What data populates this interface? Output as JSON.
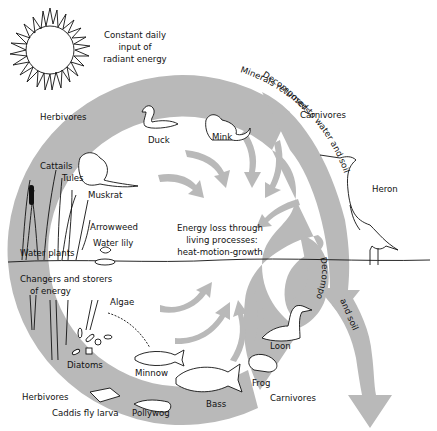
{
  "sun": {
    "icon": "sun-icon",
    "caption": [
      "Constant daily",
      "input of",
      "radiant energy"
    ]
  },
  "ring": {
    "fill_color": "#b9b9b9",
    "center_text": [
      "Energy loss through",
      "living processes:",
      "heat-motion-growth"
    ]
  },
  "sections": {
    "top_left_group": "Herbivores",
    "top_right_group": "Carnivores",
    "bottom_left_group": "Herbivores",
    "bottom_right_group": "Carnivores",
    "producers": [
      "Changers and storers",
      "of energy"
    ]
  },
  "organisms": {
    "duck": "Duck",
    "mink": "Mink",
    "muskrat": "Muskrat",
    "cattails": "Cattails",
    "tules": "Tules",
    "arrowweed": "Arrowweed",
    "water_lily": "Water lily",
    "water_plants": "Water plants",
    "algae": "Algae",
    "diatoms": "Diatoms",
    "minnow": "Minnow",
    "bass": "Bass",
    "frog": "Frog",
    "loon": "Loon",
    "heron": "Heron",
    "caddis_fly_larva": "Caddis fly larva",
    "pollywog": "Pollywog"
  },
  "flows": {
    "decomposers_outer": "Decomposers",
    "minerals": "Minerals returned to water and soil",
    "decomposers_inner": "Decomposers",
    "and_soil": "and soil"
  }
}
